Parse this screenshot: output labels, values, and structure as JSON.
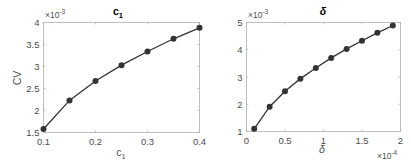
{
  "chart_data": [
    {
      "type": "line",
      "title": "c",
      "title_subscript": "1",
      "xlabel": "c",
      "xlabel_subscript": "1",
      "ylabel": "CV",
      "y_multiplier": "×10",
      "y_multiplier_exp": "-3",
      "xlim": [
        0.1,
        0.4
      ],
      "ylim": [
        1.5,
        4
      ],
      "xticks": [
        0.1,
        0.2,
        0.3,
        0.4
      ],
      "xtick_labels": [
        "0.1",
        "0.2",
        "0.3",
        "0.4"
      ],
      "yticks": [
        1.5,
        2,
        2.5,
        3,
        3.5,
        4
      ],
      "ytick_labels": [
        "1.5",
        "2",
        "2.5",
        "3",
        "3.5",
        "4"
      ],
      "grid": false,
      "series": [
        {
          "name": "CV vs c1",
          "x": [
            0.1,
            0.15,
            0.2,
            0.25,
            0.3,
            0.35,
            0.4
          ],
          "y": [
            1.58,
            2.23,
            2.67,
            3.03,
            3.34,
            3.63,
            3.88
          ],
          "color": "#333333",
          "marker": "circle"
        }
      ]
    },
    {
      "type": "line",
      "title": "δ",
      "xlabel": "δ",
      "ylabel": "",
      "x_multiplier": "×10",
      "x_multiplier_exp": "-4",
      "y_multiplier": "×10",
      "y_multiplier_exp": "-3",
      "xlim": [
        0,
        2
      ],
      "ylim": [
        1,
        5
      ],
      "xticks": [
        0,
        0.5,
        1,
        1.5,
        2
      ],
      "xtick_labels": [
        "0",
        "0.5",
        "1",
        "1.5",
        "2"
      ],
      "yticks": [
        1,
        2,
        3,
        4,
        5
      ],
      "ytick_labels": [
        "1",
        "2",
        "3",
        "4",
        "5"
      ],
      "grid": false,
      "series": [
        {
          "name": "CV vs delta",
          "x": [
            0.1,
            0.3,
            0.5,
            0.7,
            0.9,
            1.1,
            1.3,
            1.5,
            1.7,
            1.9
          ],
          "y": [
            1.1,
            1.91,
            2.48,
            2.94,
            3.33,
            3.7,
            4.03,
            4.33,
            4.62,
            4.89
          ],
          "color": "#333333",
          "marker": "circle"
        }
      ]
    }
  ]
}
